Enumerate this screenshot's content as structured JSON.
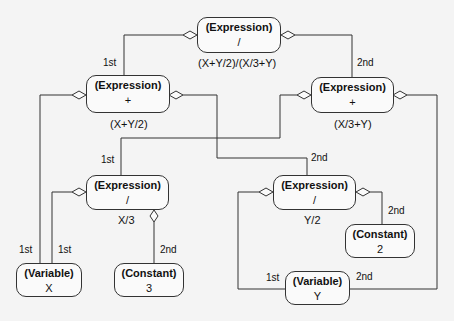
{
  "diagram": {
    "nodes": [
      {
        "id": "root",
        "kind": "(Expression)",
        "value": "/",
        "caption": "(X+Y/2)/(X/3+Y)"
      },
      {
        "id": "plus_left",
        "kind": "(Expression)",
        "value": "+",
        "caption": "(X+Y/2)"
      },
      {
        "id": "plus_right",
        "kind": "(Expression)",
        "value": "+",
        "caption": "(X/3+Y)"
      },
      {
        "id": "div_x3",
        "kind": "(Expression)",
        "value": "/",
        "caption": "X/3"
      },
      {
        "id": "div_y2",
        "kind": "(Expression)",
        "value": "/",
        "caption": "Y/2"
      },
      {
        "id": "var_x",
        "kind": "(Variable)",
        "value": "X"
      },
      {
        "id": "const_3",
        "kind": "(Constant)",
        "value": "3"
      },
      {
        "id": "const_2",
        "kind": "(Constant)",
        "value": "2"
      },
      {
        "id": "var_y",
        "kind": "(Variable)",
        "value": "Y"
      }
    ],
    "edge_labels": {
      "root_1st": "1st",
      "root_2nd": "2nd",
      "plus_right_1st": "1st",
      "plus_left_2nd": "2nd",
      "plus_left_1st": "1st",
      "div_x3_1st": "1st",
      "div_x3_2nd": "2nd",
      "div_y2_2nd": "2nd",
      "div_y2_1st": "1st",
      "plus_right_2nd": "2nd"
    },
    "edges": [
      {
        "from": "root",
        "to": "plus_left",
        "label": "1st"
      },
      {
        "from": "root",
        "to": "plus_right",
        "label": "2nd"
      },
      {
        "from": "plus_left",
        "to": "var_x",
        "label": "1st"
      },
      {
        "from": "plus_left",
        "to": "div_y2",
        "label": "2nd"
      },
      {
        "from": "plus_right",
        "to": "div_x3",
        "label": "1st"
      },
      {
        "from": "plus_right",
        "to": "var_y",
        "label": "2nd"
      },
      {
        "from": "div_x3",
        "to": "var_x",
        "label": "1st"
      },
      {
        "from": "div_x3",
        "to": "const_3",
        "label": "2nd"
      },
      {
        "from": "div_y2",
        "to": "var_y",
        "label": "1st"
      },
      {
        "from": "div_y2",
        "to": "const_2",
        "label": "2nd"
      }
    ]
  }
}
